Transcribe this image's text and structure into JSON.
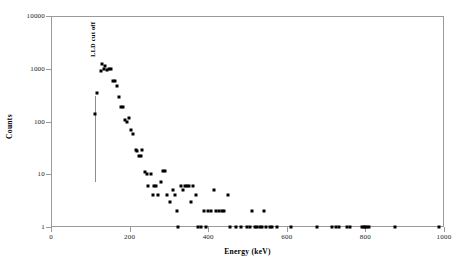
{
  "chart_data": {
    "type": "scatter",
    "title": "",
    "xlabel": "Energy (keV)",
    "ylabel": "Counts",
    "xlim": [
      0,
      1000
    ],
    "ylim": [
      1,
      10000
    ],
    "yscale": "log",
    "xscale": "linear",
    "grid": false,
    "legend": null,
    "xticks": [
      0,
      200,
      400,
      600,
      800,
      1000
    ],
    "xticklabels": [
      "0",
      "200",
      "400",
      "600",
      "800",
      "1000"
    ],
    "yticks": [
      1,
      10,
      100,
      1000,
      10000
    ],
    "yticklabels": [
      "1",
      "10",
      "100",
      "1000",
      "10000"
    ],
    "marker": "square",
    "marker_color": "#000000",
    "frame_color": "#9a9a9a",
    "background": "#ffffff",
    "annotations": [
      {
        "text": "LLD cut off",
        "x": 112,
        "rotation": 90,
        "line_from_y": 300,
        "line_to_y": 7,
        "color": "#8d8d8d"
      }
    ],
    "points": [
      {
        "x": 112,
        "y": 140
      },
      {
        "x": 118,
        "y": 350
      },
      {
        "x": 126,
        "y": 900
      },
      {
        "x": 130,
        "y": 1250
      },
      {
        "x": 134,
        "y": 1000
      },
      {
        "x": 138,
        "y": 1150
      },
      {
        "x": 143,
        "y": 960
      },
      {
        "x": 147,
        "y": 1000
      },
      {
        "x": 152,
        "y": 1000
      },
      {
        "x": 158,
        "y": 580
      },
      {
        "x": 163,
        "y": 580
      },
      {
        "x": 168,
        "y": 470
      },
      {
        "x": 174,
        "y": 290
      },
      {
        "x": 179,
        "y": 185
      },
      {
        "x": 183,
        "y": 190
      },
      {
        "x": 189,
        "y": 105
      },
      {
        "x": 194,
        "y": 100
      },
      {
        "x": 198,
        "y": 115
      },
      {
        "x": 204,
        "y": 68
      },
      {
        "x": 209,
        "y": 57
      },
      {
        "x": 216,
        "y": 29
      },
      {
        "x": 220,
        "y": 28
      },
      {
        "x": 224,
        "y": 22
      },
      {
        "x": 228,
        "y": 22
      },
      {
        "x": 232,
        "y": 29
      },
      {
        "x": 240,
        "y": 11
      },
      {
        "x": 245,
        "y": 10
      },
      {
        "x": 248,
        "y": 6
      },
      {
        "x": 254,
        "y": 10
      },
      {
        "x": 259,
        "y": 4
      },
      {
        "x": 263,
        "y": 6
      },
      {
        "x": 268,
        "y": 6
      },
      {
        "x": 273,
        "y": 4
      },
      {
        "x": 280,
        "y": 7
      },
      {
        "x": 286,
        "y": 11.5
      },
      {
        "x": 290,
        "y": 11.5
      },
      {
        "x": 296,
        "y": 4
      },
      {
        "x": 303,
        "y": 3
      },
      {
        "x": 310,
        "y": 5
      },
      {
        "x": 316,
        "y": 4
      },
      {
        "x": 320,
        "y": 2
      },
      {
        "x": 323,
        "y": 1
      },
      {
        "x": 330,
        "y": 6
      },
      {
        "x": 337,
        "y": 5
      },
      {
        "x": 342,
        "y": 6
      },
      {
        "x": 347,
        "y": 6
      },
      {
        "x": 352,
        "y": 6
      },
      {
        "x": 356,
        "y": 3
      },
      {
        "x": 362,
        "y": 6
      },
      {
        "x": 368,
        "y": 4
      },
      {
        "x": 373,
        "y": 1
      },
      {
        "x": 381,
        "y": 1
      },
      {
        "x": 389,
        "y": 2
      },
      {
        "x": 395,
        "y": 1
      },
      {
        "x": 400,
        "y": 2
      },
      {
        "x": 408,
        "y": 2
      },
      {
        "x": 414,
        "y": 5
      },
      {
        "x": 420,
        "y": 2
      },
      {
        "x": 427,
        "y": 2
      },
      {
        "x": 434,
        "y": 2
      },
      {
        "x": 441,
        "y": 2
      },
      {
        "x": 450,
        "y": 4
      },
      {
        "x": 456,
        "y": 1
      },
      {
        "x": 472,
        "y": 1
      },
      {
        "x": 483,
        "y": 1
      },
      {
        "x": 498,
        "y": 1
      },
      {
        "x": 506,
        "y": 1
      },
      {
        "x": 512,
        "y": 2
      },
      {
        "x": 519,
        "y": 1
      },
      {
        "x": 525,
        "y": 1
      },
      {
        "x": 531,
        "y": 1
      },
      {
        "x": 537,
        "y": 1
      },
      {
        "x": 543,
        "y": 2
      },
      {
        "x": 548,
        "y": 1
      },
      {
        "x": 556,
        "y": 1
      },
      {
        "x": 563,
        "y": 1
      },
      {
        "x": 576,
        "y": 1
      },
      {
        "x": 610,
        "y": 1
      },
      {
        "x": 678,
        "y": 1
      },
      {
        "x": 716,
        "y": 1
      },
      {
        "x": 724,
        "y": 1
      },
      {
        "x": 732,
        "y": 1
      },
      {
        "x": 752,
        "y": 1
      },
      {
        "x": 760,
        "y": 1
      },
      {
        "x": 792,
        "y": 1
      },
      {
        "x": 796,
        "y": 1
      },
      {
        "x": 800,
        "y": 1
      },
      {
        "x": 804,
        "y": 1
      },
      {
        "x": 808,
        "y": 1
      },
      {
        "x": 876,
        "y": 1
      },
      {
        "x": 988,
        "y": 1
      }
    ]
  }
}
